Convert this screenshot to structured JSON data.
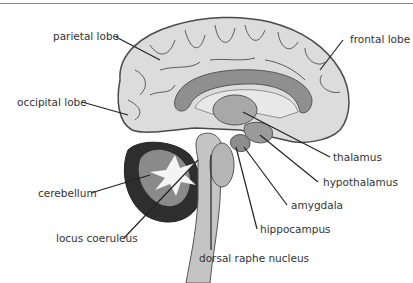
{
  "header": {
    "cropped_text": "···  ·",
    "rule_color": "#8a8a8a"
  },
  "diagram": {
    "colors": {
      "cortex": "#dcdcdc",
      "cortex_outline": "#4a4a4a",
      "corpus_callosum": "#8f8f8f",
      "thalamus": "#a8a8a8",
      "cerebellum_outer": "#2e2e2e",
      "cerebellum_inner": "#8a8a8a",
      "arbor_vitae": "#f4f4f4",
      "brainstem": "#c4c4c4",
      "leader_line": "#222222",
      "label_text": "#333333"
    },
    "labels": {
      "parietal": "parietal lobe",
      "frontal": "frontal lobe",
      "occipital": "occipital lobe",
      "thalamus": "thalamus",
      "hypothalamus": "hypothalamus",
      "cerebellum": "cerebellum",
      "amygdala": "amygdala",
      "hippocampus": "hippocampus",
      "locus": "locus coeruleus",
      "raphe": "dorsal raphe nucleus"
    }
  }
}
